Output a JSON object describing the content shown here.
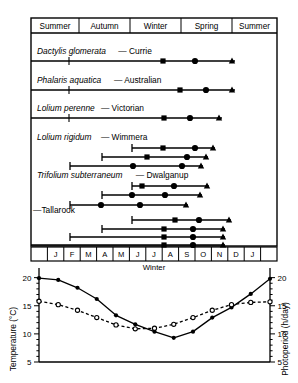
{
  "figure": {
    "frame": {
      "x": 31,
      "y": 18,
      "w": 246,
      "h": 228
    }
  },
  "season_header": {
    "name": "season-header",
    "cells": [
      {
        "label": "Summer",
        "x0": 31,
        "x1": 79
      },
      {
        "label": "Autumn",
        "x0": 79,
        "x1": 130
      },
      {
        "label": "Winter",
        "x0": 130,
        "x1": 181
      },
      {
        "label": "Spring",
        "x0": 181,
        "x1": 232
      },
      {
        "label": "Summer",
        "x0": 232,
        "x1": 277
      }
    ],
    "y0": 18,
    "y1": 33
  },
  "species_rows": [
    {
      "id": "dactylis-glomerata",
      "label_species": "Dactylis glomerata",
      "label_cultivar": "— Currie",
      "label_x": 37,
      "label_y": 54,
      "bars": [
        {
          "y": 61,
          "x0": 31,
          "x1": 235,
          "markers": [
            {
              "type": "tick",
              "x": 69
            },
            {
              "type": "square",
              "x": 163
            },
            {
              "type": "circle",
              "x": 195
            },
            {
              "type": "triangle",
              "x": 232
            }
          ]
        }
      ]
    },
    {
      "id": "phalaris-aquatica",
      "label_species": "Phalaris aquatica",
      "label_cultivar": "— Australian",
      "label_x": 37,
      "label_y": 83,
      "bars": [
        {
          "y": 90,
          "x0": 31,
          "x1": 235,
          "markers": [
            {
              "type": "tick",
              "x": 69
            },
            {
              "type": "square",
              "x": 180
            },
            {
              "type": "circle",
              "x": 206
            },
            {
              "type": "triangle",
              "x": 232
            }
          ]
        }
      ]
    },
    {
      "id": "lolium-perenne",
      "label_species": "Lolium perenne",
      "label_cultivar": "— Victorian",
      "label_x": 37,
      "label_y": 111,
      "bars": [
        {
          "y": 118,
          "x0": 31,
          "x1": 222,
          "markers": [
            {
              "type": "tick",
              "x": 69
            },
            {
              "type": "square",
              "x": 164
            },
            {
              "type": "circle",
              "x": 190
            },
            {
              "type": "triangle",
              "x": 219
            }
          ]
        }
      ]
    },
    {
      "id": "lolium-rigidum",
      "label_species": "Lolium rigidum",
      "label_cultivar": "— Wimmera",
      "label_x": 37,
      "label_y": 140,
      "bars": [
        {
          "y": 148,
          "x0": 132,
          "x1": 215,
          "markers": [
            {
              "type": "square",
              "x": 163
            },
            {
              "type": "circle",
              "x": 195
            },
            {
              "type": "triangle",
              "x": 213
            }
          ]
        },
        {
          "y": 157,
          "x0": 102,
          "x1": 208,
          "markers": [
            {
              "type": "square",
              "x": 147
            },
            {
              "type": "circle",
              "x": 187
            },
            {
              "type": "triangle",
              "x": 206
            }
          ]
        },
        {
          "y": 166,
          "x0": 70,
          "x1": 203,
          "markers": [
            {
              "type": "circle",
              "x": 133
            },
            {
              "type": "circle",
              "x": 182
            },
            {
              "type": "triangle",
              "x": 201
            }
          ]
        }
      ]
    },
    {
      "id": "trifolium-subterraneum",
      "label_species": "Trifolium subterraneum",
      "label_cultivar": "— Dwalganup",
      "label_x": 37,
      "label_y": 178,
      "bars": [
        {
          "y": 186,
          "x0": 132,
          "x1": 209,
          "markers": [
            {
              "type": "square",
              "x": 142
            },
            {
              "type": "circle",
              "x": 174
            },
            {
              "type": "triangle",
              "x": 207
            }
          ]
        },
        {
          "y": 195,
          "x0": 102,
          "x1": 202,
          "markers": [
            {
              "type": "circle",
              "x": 132
            },
            {
              "type": "circle",
              "x": 165
            },
            {
              "type": "triangle",
              "x": 200
            }
          ]
        },
        {
          "y": 205,
          "x0": 70,
          "x1": 188,
          "markers": [
            {
              "type": "circle",
              "x": 101
            },
            {
              "type": "circle",
              "x": 140
            },
            {
              "type": "triangle",
              "x": 186
            }
          ]
        }
      ]
    },
    {
      "id": "tallarook",
      "label_species": "",
      "label_cultivar": "—Tallarook",
      "label_x": 33,
      "label_y": 213,
      "bars": [
        {
          "y": 220,
          "x0": 132,
          "x1": 231,
          "markers": [
            {
              "type": "square",
              "x": 175
            },
            {
              "type": "circle",
              "x": 199
            },
            {
              "type": "triangle",
              "x": 229
            }
          ]
        },
        {
          "y": 229,
          "x0": 102,
          "x1": 225,
          "markers": [
            {
              "type": "square",
              "x": 164
            },
            {
              "type": "circle",
              "x": 193
            },
            {
              "type": "triangle",
              "x": 223
            }
          ]
        },
        {
          "y": 237,
          "x0": 70,
          "x1": 225,
          "markers": [
            {
              "type": "square",
              "x": 164
            },
            {
              "type": "circle",
              "x": 193
            },
            {
              "type": "triangle",
              "x": 223
            }
          ]
        },
        {
          "y": 245,
          "x0": 31,
          "x1": 225,
          "markers": [
            {
              "type": "square",
              "x": 164
            },
            {
              "type": "circle",
              "x": 193
            },
            {
              "type": "triangle",
              "x": 223
            }
          ]
        }
      ]
    }
  ],
  "month_axis": {
    "name": "month-axis",
    "y0": 247,
    "y1": 261,
    "x0": 31,
    "x1": 277,
    "cells": [
      "",
      "J",
      "F",
      "M",
      "A",
      "M",
      "J",
      "J",
      "A",
      "S",
      "O",
      "N",
      "D",
      "J",
      ""
    ]
  },
  "winter_label": {
    "text": "Winter",
    "x": 154,
    "y": 270
  },
  "chart_data": {
    "type": "line",
    "title": "",
    "xlabel": "",
    "ylabel": "Temperature (°C)",
    "y2label": "Photoperiod (h/day)",
    "x": [
      "J",
      "F",
      "M",
      "A",
      "M",
      "J",
      "J",
      "A",
      "S",
      "O",
      "N",
      "D",
      "J"
    ],
    "ylim": [
      5,
      21
    ],
    "yticks": [
      5,
      10,
      15,
      20
    ],
    "y2lim": [
      5,
      21
    ],
    "y2ticks": [
      5,
      10,
      15,
      20
    ],
    "grid": false,
    "legend": "none",
    "series": [
      {
        "name": "Temperature",
        "marker": "filled-circle",
        "linestyle": "solid",
        "values": [
          19.9,
          19.6,
          18.2,
          16.2,
          13.3,
          11.7,
          10.4,
          9.3,
          10.4,
          12.9,
          14.7,
          17.1,
          19.8
        ]
      },
      {
        "name": "Photoperiod",
        "marker": "open-circle",
        "linestyle": "dashed",
        "values": [
          15.8,
          15.2,
          14.2,
          12.9,
          11.6,
          10.9,
          11.0,
          11.7,
          12.9,
          14.2,
          15.2,
          15.6,
          15.7
        ]
      }
    ]
  },
  "colors": {
    "ink": "#000000",
    "paper": "#ffffff"
  }
}
